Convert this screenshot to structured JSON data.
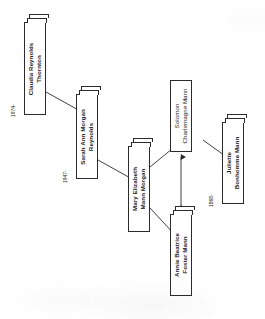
{
  "diagram": {
    "kind": "family-tree",
    "orientation": "rotated-90-ccw",
    "background_color": "#ffffff",
    "line_color": "#2b2b2b",
    "text_color": "#1a1a1a"
  },
  "nodes": [
    {
      "id": "claudia",
      "name_line1": "Claudia Reynolds",
      "name_line2": "Thornton",
      "date": "1974-",
      "style": "stacked"
    },
    {
      "id": "sarah",
      "name_line1": "Sarah Ann Morgan",
      "name_line2": "Reynolds",
      "date": "1947-",
      "style": "stacked"
    },
    {
      "id": "mary",
      "name_line1": "Mary Elizabeth",
      "name_line2": "Mann Morgan",
      "date": "",
      "style": "stacked"
    },
    {
      "id": "solomon",
      "name_line1": "Solomon",
      "name_line2": "Charlemagne Mann",
      "date": "",
      "style": "flat"
    },
    {
      "id": "annie",
      "name_line1": "Annie Beatrice",
      "name_line2": "Foster Mann",
      "date": "",
      "style": "stacked"
    },
    {
      "id": "juliette",
      "name_line1": "Juliette",
      "name_line2": "Bonhomme Mann",
      "date": "1868-",
      "style": "stacked"
    }
  ],
  "connectors": [
    {
      "id": "claudia-sarah",
      "from": "claudia",
      "to": "sarah",
      "type": "descent"
    },
    {
      "id": "sarah-mary",
      "from": "sarah",
      "to": "mary",
      "type": "descent"
    },
    {
      "id": "mary-solomon",
      "from": "mary",
      "to": "solomon",
      "type": "descent"
    },
    {
      "id": "mary-annie",
      "from": "mary",
      "to": "annie",
      "type": "descent"
    },
    {
      "id": "solomon-juliette",
      "from": "solomon",
      "to": "juliette",
      "type": "descent"
    },
    {
      "id": "solomon-annie",
      "from": "solomon",
      "to": "annie",
      "type": "marriage-arrow"
    }
  ]
}
